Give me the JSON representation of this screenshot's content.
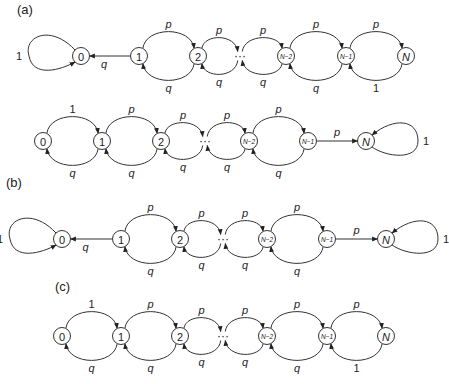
{
  "figure": {
    "panels": [
      {
        "id": "a1",
        "label": "(a)",
        "label_pos": [
          17,
          14
        ],
        "y": 56,
        "nodes": [
          {
            "id": "0",
            "text": "0",
            "x": 81
          },
          {
            "id": "1",
            "text": "1",
            "x": 139
          },
          {
            "id": "2",
            "text": "2",
            "x": 198
          },
          {
            "id": "N-2",
            "text": "N−2",
            "x": 286
          },
          {
            "id": "N-1",
            "text": "N−1",
            "x": 346
          },
          {
            "id": "N",
            "text": "N",
            "x": 406
          }
        ],
        "dots_x": 240,
        "edges": [
          {
            "from": "0",
            "to": "0",
            "type": "self-left",
            "label": "1"
          },
          {
            "from": "1",
            "to": "0",
            "type": "straight",
            "label": "q"
          },
          {
            "from": "1",
            "to": "2",
            "type": "arc-up",
            "label": "p"
          },
          {
            "from": "2",
            "to": "1",
            "type": "arc-down",
            "label": "q"
          },
          {
            "from": "2",
            "to": "dots",
            "type": "arc-up",
            "label": "p"
          },
          {
            "from": "dots",
            "to": "2",
            "type": "arc-down",
            "label": "q"
          },
          {
            "from": "dots",
            "to": "N-2",
            "type": "arc-up",
            "label": "p"
          },
          {
            "from": "N-2",
            "to": "dots",
            "type": "arc-down",
            "label": "q"
          },
          {
            "from": "N-2",
            "to": "N-1",
            "type": "arc-up",
            "label": "p"
          },
          {
            "from": "N-1",
            "to": "N-2",
            "type": "arc-down",
            "label": "q"
          },
          {
            "from": "N-1",
            "to": "N",
            "type": "arc-up",
            "label": "p"
          },
          {
            "from": "N",
            "to": "N-1",
            "type": "arc-down",
            "label": "1"
          }
        ]
      },
      {
        "id": "a2",
        "label": "",
        "y": 141,
        "nodes": [
          {
            "id": "0",
            "text": "0",
            "x": 43
          },
          {
            "id": "1",
            "text": "1",
            "x": 102
          },
          {
            "id": "2",
            "text": "2",
            "x": 161
          },
          {
            "id": "N-2",
            "text": "N−2",
            "x": 249
          },
          {
            "id": "N-1",
            "text": "N−1",
            "x": 308
          },
          {
            "id": "N",
            "text": "N",
            "x": 366
          }
        ],
        "dots_x": 205,
        "edges": [
          {
            "from": "0",
            "to": "1",
            "type": "arc-up",
            "label": "1"
          },
          {
            "from": "1",
            "to": "0",
            "type": "arc-down",
            "label": "q"
          },
          {
            "from": "1",
            "to": "2",
            "type": "arc-up",
            "label": "p"
          },
          {
            "from": "2",
            "to": "1",
            "type": "arc-down",
            "label": "q"
          },
          {
            "from": "2",
            "to": "dots",
            "type": "arc-up",
            "label": "p"
          },
          {
            "from": "dots",
            "to": "2",
            "type": "arc-down",
            "label": "q"
          },
          {
            "from": "dots",
            "to": "N-2",
            "type": "arc-up",
            "label": "p"
          },
          {
            "from": "N-2",
            "to": "dots",
            "type": "arc-down",
            "label": "q"
          },
          {
            "from": "N-2",
            "to": "N-1",
            "type": "arc-up",
            "label": "p"
          },
          {
            "from": "N-1",
            "to": "N-2",
            "type": "arc-down",
            "label": "q"
          },
          {
            "from": "N-1",
            "to": "N",
            "type": "straight",
            "label": "p"
          },
          {
            "from": "N",
            "to": "N",
            "type": "self-right",
            "label": "1"
          }
        ]
      },
      {
        "id": "b",
        "label": "(b)",
        "label_pos": [
          6,
          187
        ],
        "y": 239,
        "nodes": [
          {
            "id": "0",
            "text": "0",
            "x": 62
          },
          {
            "id": "1",
            "text": "1",
            "x": 121
          },
          {
            "id": "2",
            "text": "2",
            "x": 180
          },
          {
            "id": "N-2",
            "text": "N−2",
            "x": 267
          },
          {
            "id": "N-1",
            "text": "N−1",
            "x": 327
          },
          {
            "id": "N",
            "text": "N",
            "x": 386
          }
        ],
        "dots_x": 223,
        "edges": [
          {
            "from": "0",
            "to": "0",
            "type": "self-left",
            "label": "1"
          },
          {
            "from": "1",
            "to": "0",
            "type": "straight",
            "label": "q"
          },
          {
            "from": "1",
            "to": "2",
            "type": "arc-up",
            "label": "p"
          },
          {
            "from": "2",
            "to": "1",
            "type": "arc-down",
            "label": "q"
          },
          {
            "from": "2",
            "to": "dots",
            "type": "arc-up",
            "label": "p"
          },
          {
            "from": "dots",
            "to": "2",
            "type": "arc-down",
            "label": "q"
          },
          {
            "from": "dots",
            "to": "N-2",
            "type": "arc-up",
            "label": "p"
          },
          {
            "from": "N-2",
            "to": "dots",
            "type": "arc-down",
            "label": "q"
          },
          {
            "from": "N-2",
            "to": "N-1",
            "type": "arc-up",
            "label": "p"
          },
          {
            "from": "N-1",
            "to": "N-2",
            "type": "arc-down",
            "label": "q"
          },
          {
            "from": "N-1",
            "to": "N",
            "type": "straight",
            "label": "p"
          },
          {
            "from": "N",
            "to": "N",
            "type": "self-right",
            "label": "1"
          }
        ]
      },
      {
        "id": "c",
        "label": "(c)",
        "label_pos": [
          55,
          291
        ],
        "y": 336,
        "nodes": [
          {
            "id": "0",
            "text": "0",
            "x": 62
          },
          {
            "id": "1",
            "text": "1",
            "x": 121
          },
          {
            "id": "2",
            "text": "2",
            "x": 180
          },
          {
            "id": "N-2",
            "text": "N−2",
            "x": 267
          },
          {
            "id": "N-1",
            "text": "N−1",
            "x": 327
          },
          {
            "id": "N",
            "text": "N",
            "x": 386
          }
        ],
        "dots_x": 223,
        "edges": [
          {
            "from": "0",
            "to": "1",
            "type": "arc-up",
            "label": "1"
          },
          {
            "from": "1",
            "to": "0",
            "type": "arc-down",
            "label": "q"
          },
          {
            "from": "1",
            "to": "2",
            "type": "arc-up",
            "label": "p"
          },
          {
            "from": "2",
            "to": "1",
            "type": "arc-down",
            "label": "q"
          },
          {
            "from": "2",
            "to": "dots",
            "type": "arc-up",
            "label": "p"
          },
          {
            "from": "dots",
            "to": "2",
            "type": "arc-down",
            "label": "q"
          },
          {
            "from": "dots",
            "to": "N-2",
            "type": "arc-up",
            "label": "p"
          },
          {
            "from": "N-2",
            "to": "dots",
            "type": "arc-down",
            "label": "q"
          },
          {
            "from": "N-2",
            "to": "N-1",
            "type": "arc-up",
            "label": "p"
          },
          {
            "from": "N-1",
            "to": "N-2",
            "type": "arc-down",
            "label": "q"
          },
          {
            "from": "N-1",
            "to": "N",
            "type": "arc-up",
            "label": "p"
          },
          {
            "from": "N",
            "to": "N-1",
            "type": "arc-down",
            "label": "1"
          }
        ]
      }
    ],
    "dots_text": "···",
    "colors": {
      "stroke": "#333333",
      "text": "#222222",
      "background": "#ffffff"
    }
  }
}
